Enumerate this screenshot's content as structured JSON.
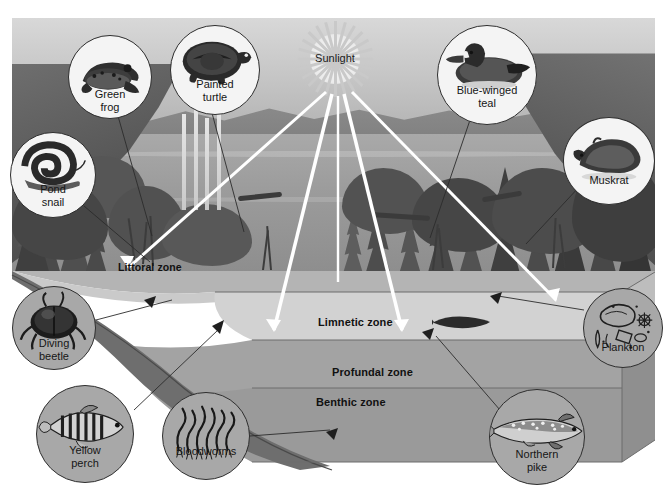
{
  "diagram": {
    "sun": {
      "label": "Sunlight"
    },
    "zones": [
      {
        "id": "littoral",
        "label": "Littoral zone"
      },
      {
        "id": "limnetic",
        "label": "Limnetic zone"
      },
      {
        "id": "profundal",
        "label": "Profundal zone"
      },
      {
        "id": "benthic",
        "label": "Benthic zone"
      }
    ],
    "organisms": [
      {
        "id": "green-frog",
        "label": "Green\nfrog",
        "icon": "frog-icon",
        "fill": "light"
      },
      {
        "id": "painted-turtle",
        "label": "Painted\nturtle",
        "icon": "turtle-icon",
        "fill": "light"
      },
      {
        "id": "pond-snail",
        "label": "Pond\nsnail",
        "icon": "snail-icon",
        "fill": "light"
      },
      {
        "id": "blue-winged-teal",
        "label": "Blue-winged\nteal",
        "icon": "duck-icon",
        "fill": "light"
      },
      {
        "id": "muskrat",
        "label": "Muskrat",
        "icon": "muskrat-icon",
        "fill": "light"
      },
      {
        "id": "plankton",
        "label": "Plankton",
        "icon": "plankton-icon",
        "fill": "gray"
      },
      {
        "id": "diving-beetle",
        "label": "Diving\nbeetle",
        "icon": "beetle-icon",
        "fill": "gray"
      },
      {
        "id": "yellow-perch",
        "label": "Yellow\nperch",
        "icon": "perch-icon",
        "fill": "gray"
      },
      {
        "id": "bloodworms",
        "label": "Bloodworms",
        "icon": "bloodworm-icon",
        "fill": "gray"
      },
      {
        "id": "northern-pike",
        "label": "Northern\npike",
        "icon": "pike-icon",
        "fill": "gray"
      }
    ],
    "colors": {
      "background": "#ffffff",
      "water": "#9c9c9c",
      "littoral_band": "#c4c4c4",
      "limnetic_band": "#cfcfcf",
      "profundal_band": "#a6a6a6",
      "benthic_band": "#9b9b9b",
      "beam": "#ffffff",
      "leader_line": "#2b2b2b",
      "label_text": "#111111"
    }
  }
}
